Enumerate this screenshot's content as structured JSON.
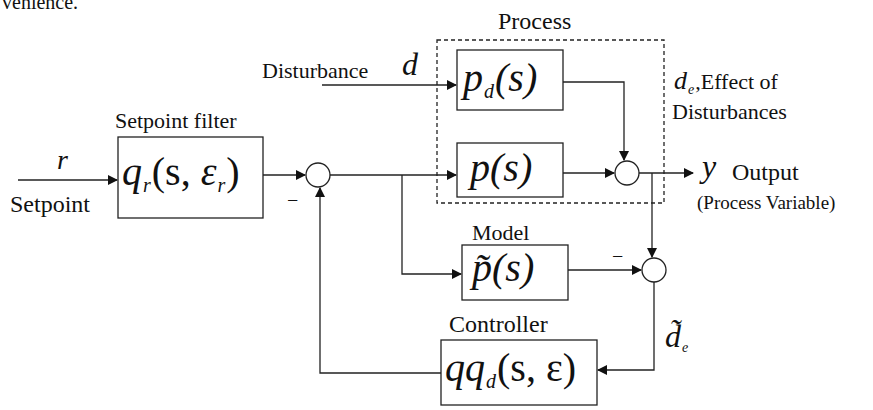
{
  "header_fragment": "venience.",
  "inputs": {
    "setpoint_symbol": "r",
    "setpoint_label": "Setpoint",
    "disturbance_label": "Disturbance",
    "disturbance_symbol": "d"
  },
  "blocks": {
    "setpoint_filter": {
      "title": "Setpoint filter",
      "fn": "q",
      "sub": "r",
      "args_open": "(s, ",
      "eps": "ε",
      "eps_sub": "r",
      "args_close": ")"
    },
    "process_group": {
      "title": "Process"
    },
    "disturbance_model": {
      "fn": "p",
      "sub": "d",
      "args": "(s)"
    },
    "plant": {
      "fn": "p",
      "args": "(s)"
    },
    "model": {
      "title": "Model",
      "fn": "p̃",
      "args": "(s)"
    },
    "controller": {
      "title": "Controller",
      "fn": "qq",
      "sub": "d",
      "args": "(s, ε)"
    }
  },
  "signals": {
    "disturbance_effect_symbol": "d",
    "disturbance_effect_sub": "e",
    "disturbance_effect_label_1": ",Effect of",
    "disturbance_effect_label_2": "Disturbances",
    "output_symbol": "y",
    "output_label": "Output",
    "output_sublabel": "(Process Variable)",
    "estimated_disturbance_symbol": "d̃",
    "estimated_disturbance_sub": "e"
  },
  "junction_signs": {
    "feedback_sign": "−",
    "model_sign": "−"
  }
}
